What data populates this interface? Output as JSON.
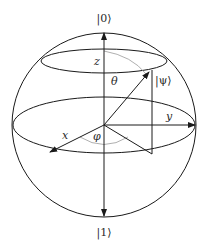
{
  "diagram": {
    "labels": {
      "north_state": "|0⟩",
      "south_state": "|1⟩",
      "state_vector": "|ψ⟩",
      "z_axis": "z",
      "x_axis": "x",
      "y_axis": "y",
      "polar_angle": "θ",
      "azimuthal_angle": "φ"
    },
    "colors": {
      "line": "#1a1a1a",
      "arc": "#9a9a9a",
      "text": "#2a2a2a"
    }
  }
}
